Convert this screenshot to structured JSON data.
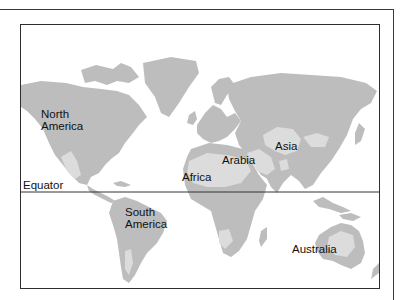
{
  "map": {
    "type": "world-desert-regions",
    "colors": {
      "land": "#bdbdbd",
      "desert": "#dcdcdc",
      "water": "#ffffff",
      "lines": "#333333",
      "text": "#111111"
    },
    "equator_label": "Equator",
    "labels": {
      "north_america": [
        "North",
        "America"
      ],
      "south_america": [
        "South",
        "America"
      ],
      "africa": "Africa",
      "arabia": "Arabia",
      "asia": "Asia",
      "australia": "Australia"
    }
  }
}
